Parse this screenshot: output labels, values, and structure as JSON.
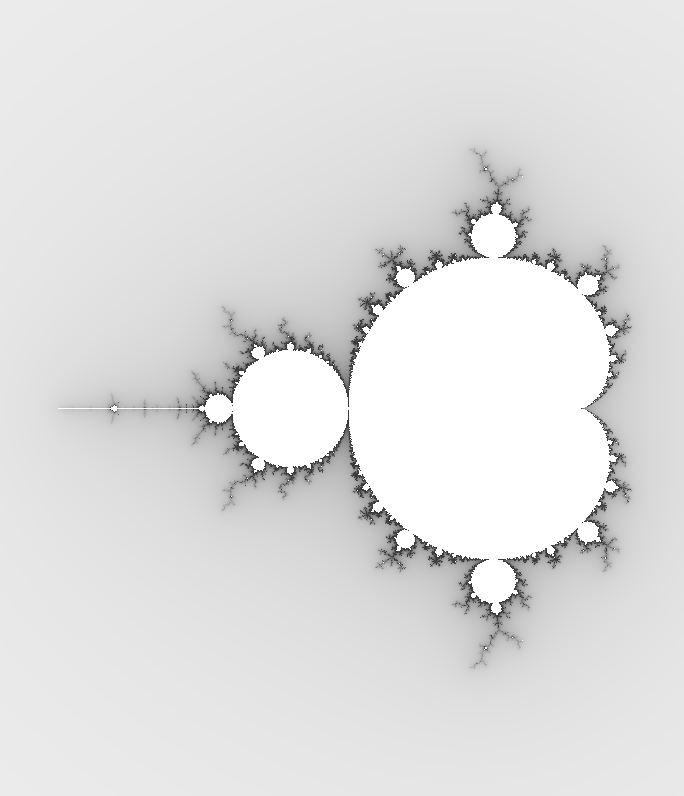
{
  "image": {
    "subject": "Mandelbrot set",
    "width": 684,
    "height": 796,
    "background_color": "#ffffff",
    "interior_color": "#ffffff",
    "boundary_color": "#3c3c3c"
  },
  "view": {
    "center_x_px": 522,
    "center_y_px": 408,
    "pixels_per_unit": 232,
    "max_iterations": 400
  },
  "features": [
    {
      "name": "main-cardioid",
      "cusp_px": [
        580,
        408
      ]
    },
    {
      "name": "period-2-bulb",
      "center_px": [
        290,
        408
      ],
      "radius_px": 58
    },
    {
      "name": "top-bulb",
      "center_px": [
        492,
        232
      ]
    },
    {
      "name": "bottom-bulb",
      "center_px": [
        492,
        588
      ]
    },
    {
      "name": "mini-mandelbrot",
      "center_px": [
        113,
        408
      ]
    }
  ]
}
